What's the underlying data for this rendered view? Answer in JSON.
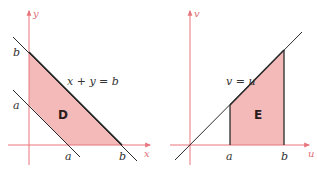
{
  "colors": {
    "axis": "#e8747c",
    "fill": "#f4b9b9",
    "line": "#2b2b2b",
    "label": "#333333",
    "axis_label": "#e0707a"
  },
  "left_plot": {
    "x_axis_label": "x",
    "y_axis_label": "y",
    "region_label": "D",
    "equation": "x + y = b",
    "y_ticks": [
      {
        "label": "b"
      },
      {
        "label": "a"
      }
    ],
    "x_ticks": [
      {
        "label": "a"
      },
      {
        "label": "b"
      }
    ]
  },
  "right_plot": {
    "x_axis_label": "u",
    "y_axis_label": "v",
    "region_label": "E",
    "equation": "v = u",
    "x_ticks": [
      {
        "label": "a"
      },
      {
        "label": "b"
      }
    ]
  }
}
